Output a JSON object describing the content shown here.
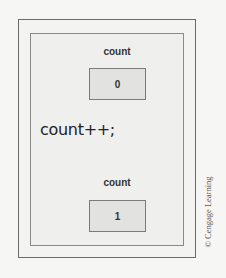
{
  "diagram": {
    "before": {
      "variable_name": "count",
      "value": "0"
    },
    "statement": "count++;",
    "after": {
      "variable_name": "count",
      "value": "1"
    },
    "credit": "© Cengage Learning"
  }
}
